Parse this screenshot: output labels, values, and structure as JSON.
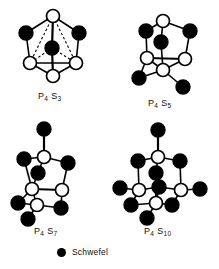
{
  "figure": {
    "background_color": "#ffffff",
    "line_color": "#000000",
    "sulfur_color": "#000000",
    "phosphorus_color": "#ffffff"
  },
  "legend": {
    "label": "Schwefel",
    "marker": "filled-circle",
    "marker_color": "#000000"
  },
  "structures": [
    {
      "id": "p4s3",
      "formula": "P4S3",
      "label_main": "P",
      "label_sub1": "4",
      "label_el2": "S",
      "label_sub2": "3",
      "caption_left": 38,
      "caption_top": 91,
      "atoms": {
        "phosphorus_count": 4,
        "sulfur_count": 3
      },
      "nodes": [
        {
          "id": "P1",
          "type": "P",
          "x": 53,
          "y": 16
        },
        {
          "id": "S1",
          "type": "S",
          "x": 26,
          "y": 33
        },
        {
          "id": "S2",
          "type": "S",
          "x": 79,
          "y": 33
        },
        {
          "id": "S3",
          "type": "S",
          "x": 52,
          "y": 48
        },
        {
          "id": "P2",
          "type": "P",
          "x": 30,
          "y": 63
        },
        {
          "id": "P3",
          "type": "P",
          "x": 76,
          "y": 63
        },
        {
          "id": "P4",
          "type": "P",
          "x": 53,
          "y": 76
        }
      ],
      "bonds_solid": [
        [
          "P1",
          "S1"
        ],
        [
          "P1",
          "S2"
        ],
        [
          "S1",
          "P2"
        ],
        [
          "S2",
          "P3"
        ],
        [
          "P2",
          "P3"
        ],
        [
          "P2",
          "P4"
        ],
        [
          "P3",
          "P4"
        ],
        [
          "P1",
          "S3"
        ],
        [
          "S3",
          "P4"
        ]
      ],
      "bonds_dashed": [
        [
          "P1",
          "P2"
        ],
        [
          "P1",
          "P3"
        ],
        [
          "P1",
          "P4"
        ],
        [
          "S3",
          "P2"
        ],
        [
          "S3",
          "P3"
        ]
      ]
    },
    {
      "id": "p4s5",
      "formula": "P4S5",
      "label_main": "P",
      "label_sub1": "4",
      "label_el2": "S",
      "label_sub2": "5",
      "caption_left": 148,
      "caption_top": 98,
      "atoms": {
        "phosphorus_count": 4,
        "sulfur_count": 5
      },
      "nodes": [
        {
          "id": "P1",
          "type": "P",
          "x": 163,
          "y": 21
        },
        {
          "id": "S1",
          "type": "S",
          "x": 146,
          "y": 31
        },
        {
          "id": "S2",
          "type": "S",
          "x": 190,
          "y": 31
        },
        {
          "id": "S3",
          "type": "S",
          "x": 161,
          "y": 42
        },
        {
          "id": "P2",
          "type": "P",
          "x": 147,
          "y": 58
        },
        {
          "id": "P3",
          "type": "P",
          "x": 185,
          "y": 59
        },
        {
          "id": "P4",
          "type": "P",
          "x": 163,
          "y": 70
        },
        {
          "id": "S4",
          "type": "S",
          "x": 139,
          "y": 78
        },
        {
          "id": "S5",
          "type": "S",
          "x": 183,
          "y": 87
        }
      ],
      "bonds_solid": [
        [
          "P1",
          "S1"
        ],
        [
          "P1",
          "S2"
        ],
        [
          "S1",
          "P2"
        ],
        [
          "S2",
          "P3"
        ],
        [
          "P1",
          "S3"
        ],
        [
          "S3",
          "P4"
        ],
        [
          "P2",
          "P3"
        ],
        [
          "P2",
          "P4"
        ],
        [
          "P3",
          "P4"
        ],
        [
          "P2",
          "S4"
        ],
        [
          "S4",
          "P4"
        ],
        [
          "P4",
          "S5"
        ]
      ],
      "bonds_dashed": []
    },
    {
      "id": "p4s7",
      "formula": "P4S7",
      "label_main": "P",
      "label_sub1": "4",
      "label_el2": "S",
      "label_sub2": "7",
      "caption_left": 34,
      "caption_top": 226,
      "atoms": {
        "phosphorus_count": 4,
        "sulfur_count": 7
      },
      "nodes": [
        {
          "id": "St",
          "type": "S",
          "x": 44,
          "y": 129
        },
        {
          "id": "P1",
          "type": "P",
          "x": 44,
          "y": 157
        },
        {
          "id": "S1",
          "type": "S",
          "x": 24,
          "y": 159
        },
        {
          "id": "S2",
          "type": "S",
          "x": 68,
          "y": 163
        },
        {
          "id": "S3",
          "type": "S",
          "x": 38,
          "y": 173
        },
        {
          "id": "P2",
          "type": "P",
          "x": 32,
          "y": 189
        },
        {
          "id": "P3",
          "type": "P",
          "x": 62,
          "y": 190
        },
        {
          "id": "P4",
          "type": "P",
          "x": 37,
          "y": 205
        },
        {
          "id": "S4",
          "type": "S",
          "x": 18,
          "y": 203
        },
        {
          "id": "S5",
          "type": "S",
          "x": 61,
          "y": 208
        },
        {
          "id": "S6",
          "type": "S",
          "x": 28,
          "y": 219
        }
      ],
      "bonds_solid": [
        [
          "St",
          "P1"
        ],
        [
          "P1",
          "S1"
        ],
        [
          "P1",
          "S2"
        ],
        [
          "P1",
          "S3"
        ],
        [
          "S1",
          "P2"
        ],
        [
          "S2",
          "P3"
        ],
        [
          "S3",
          "P2"
        ],
        [
          "P2",
          "P3"
        ],
        [
          "P2",
          "S4"
        ],
        [
          "P2",
          "P4"
        ],
        [
          "S4",
          "P4"
        ],
        [
          "P4",
          "S5"
        ],
        [
          "S5",
          "P3"
        ],
        [
          "P4",
          "S6"
        ],
        [
          "P3",
          "S5"
        ]
      ],
      "bonds_dashed": []
    },
    {
      "id": "p4s10",
      "formula": "P4S10",
      "label_main": "P",
      "label_sub1": "4",
      "label_el2": "S",
      "label_sub2": "10",
      "caption_left": 144,
      "caption_top": 226,
      "atoms": {
        "phosphorus_count": 4,
        "sulfur_count": 10
      },
      "nodes": [
        {
          "id": "St",
          "type": "S",
          "x": 158,
          "y": 130
        },
        {
          "id": "P1",
          "type": "P",
          "x": 158,
          "y": 157
        },
        {
          "id": "S1",
          "type": "S",
          "x": 138,
          "y": 161
        },
        {
          "id": "S2",
          "type": "S",
          "x": 180,
          "y": 161
        },
        {
          "id": "S3",
          "type": "S",
          "x": 156,
          "y": 173
        },
        {
          "id": "P2",
          "type": "P",
          "x": 139,
          "y": 190
        },
        {
          "id": "P3",
          "type": "P",
          "x": 181,
          "y": 190
        },
        {
          "id": "P4",
          "type": "P",
          "x": 156,
          "y": 203
        },
        {
          "id": "S4",
          "type": "S",
          "x": 120,
          "y": 188
        },
        {
          "id": "S5",
          "type": "S",
          "x": 200,
          "y": 189
        },
        {
          "id": "S6",
          "type": "S",
          "x": 131,
          "y": 205
        },
        {
          "id": "S7",
          "type": "S",
          "x": 172,
          "y": 205
        },
        {
          "id": "S8",
          "type": "S",
          "x": 147,
          "y": 218
        },
        {
          "id": "S9",
          "type": "S",
          "x": 159,
          "y": 187
        }
      ],
      "bonds_solid": [
        [
          "St",
          "P1"
        ],
        [
          "P1",
          "S1"
        ],
        [
          "P1",
          "S2"
        ],
        [
          "P1",
          "S3"
        ],
        [
          "S1",
          "P2"
        ],
        [
          "S2",
          "P3"
        ],
        [
          "S3",
          "P4"
        ],
        [
          "P2",
          "S4"
        ],
        [
          "P3",
          "S5"
        ],
        [
          "P2",
          "S6"
        ],
        [
          "P3",
          "S7"
        ],
        [
          "S6",
          "P4"
        ],
        [
          "S7",
          "P4"
        ],
        [
          "P4",
          "S8"
        ],
        [
          "P2",
          "S9"
        ],
        [
          "P3",
          "S9"
        ],
        [
          "S9",
          "P4"
        ]
      ],
      "bonds_dashed": []
    }
  ]
}
